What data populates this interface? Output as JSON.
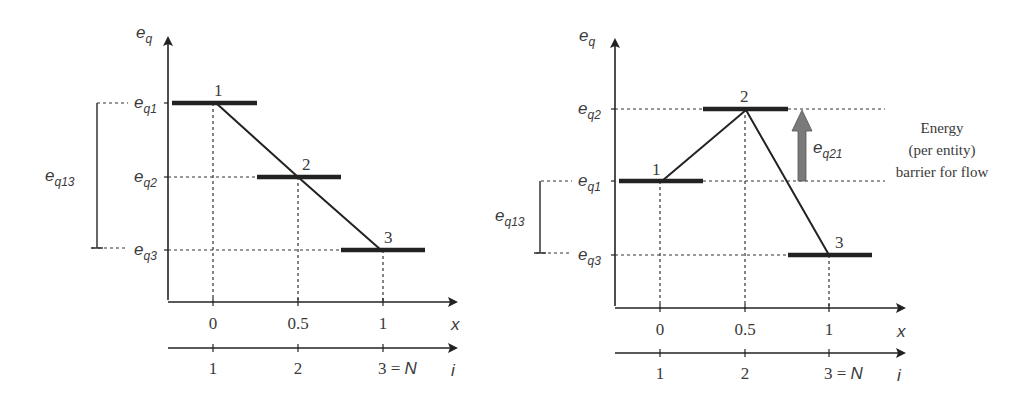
{
  "left_diagram": {
    "y_axis_label": "e",
    "y_axis_sub": "q",
    "x_axis_label": "x",
    "i_axis_label": "i",
    "level_labels": [
      {
        "main": "e",
        "sub": "q1"
      },
      {
        "main": "e",
        "sub": "q2"
      },
      {
        "main": "e",
        "sub": "q3"
      }
    ],
    "bracket_label": {
      "main": "e",
      "sub": "q13"
    },
    "state_numbers": [
      "1",
      "2",
      "3"
    ],
    "x_ticks": [
      "0",
      "0.5",
      "1"
    ],
    "i_ticks": [
      "1",
      "2",
      "3 = "
    ],
    "i_last_symbol": "N"
  },
  "right_diagram": {
    "y_axis_label": "e",
    "y_axis_sub": "q",
    "x_axis_label": "x",
    "i_axis_label": "i",
    "level_labels": [
      {
        "main": "e",
        "sub": "q2"
      },
      {
        "main": "e",
        "sub": "q1"
      },
      {
        "main": "e",
        "sub": "q3"
      }
    ],
    "bracket_label": {
      "main": "e",
      "sub": "q13"
    },
    "arrow_label": {
      "main": "e",
      "sub": "q21"
    },
    "annotation": [
      "Energy",
      "(per entity)",
      "barrier for flow"
    ],
    "state_numbers": [
      "1",
      "2",
      "3"
    ],
    "x_ticks": [
      "0",
      "0.5",
      "1"
    ],
    "i_ticks": [
      "1",
      "2",
      "3 = "
    ],
    "i_last_symbol": "N",
    "arrow_color": "#7a7a7a"
  }
}
